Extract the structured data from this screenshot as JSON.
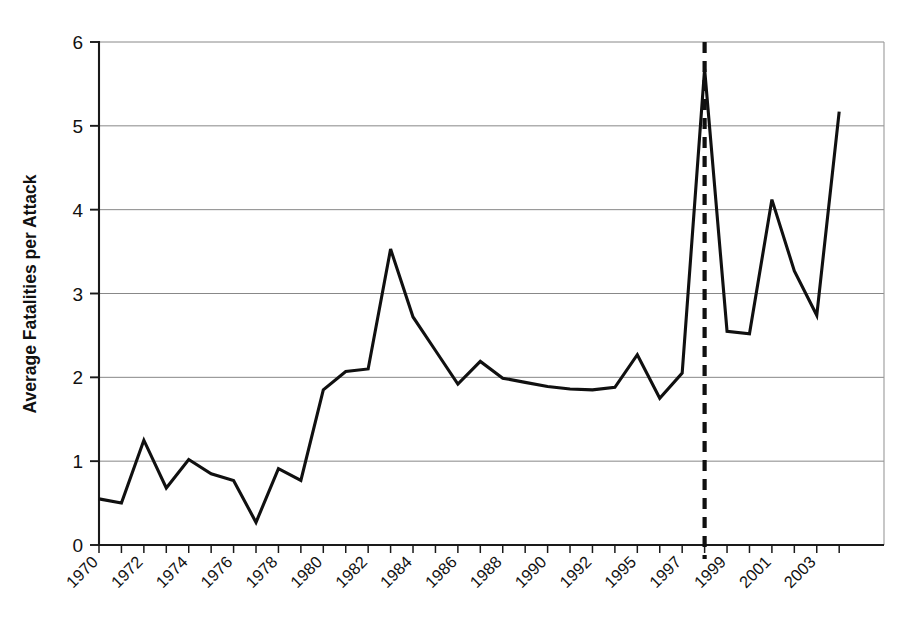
{
  "chart_data": {
    "type": "line",
    "title": "",
    "xlabel": "",
    "ylabel": "Average Fatalities per Attack",
    "ylim": [
      0,
      6
    ],
    "yticks": [
      0,
      1,
      2,
      3,
      4,
      5,
      6
    ],
    "ytick_labels": [
      "0",
      "1",
      "2",
      "3",
      "4",
      "5",
      "6"
    ],
    "grid": "horizontal",
    "legend": "none",
    "x": [
      1970,
      1971,
      1972,
      1973,
      1974,
      1975,
      1976,
      1977,
      1978,
      1979,
      1980,
      1981,
      1982,
      1983,
      1984,
      1985,
      1986,
      1987,
      1988,
      1989,
      1990,
      1991,
      1992,
      1994,
      1995,
      1996,
      1997,
      1998,
      1999,
      2000,
      2001,
      2002,
      2003,
      2004
    ],
    "xtick_labels": [
      "1970",
      "",
      "1972",
      "",
      "1974",
      "",
      "1976",
      "",
      "1978",
      "",
      "1980",
      "",
      "1982",
      "",
      "1984",
      "",
      "1986",
      "",
      "1988",
      "",
      "1990",
      "",
      "1992",
      "",
      "1995",
      "",
      "1997",
      "",
      "1999",
      "",
      "2001",
      "",
      "2003",
      ""
    ],
    "xtick_labels_shown": [
      "1970",
      "1972",
      "1974",
      "1976",
      "1978",
      "1980",
      "1982",
      "1984",
      "1986",
      "1988",
      "1990",
      "1992",
      "1995",
      "1997",
      "1999",
      "2001",
      "2003"
    ],
    "values": [
      0.55,
      0.5,
      1.25,
      0.68,
      1.02,
      0.85,
      0.77,
      0.27,
      0.91,
      0.77,
      1.85,
      2.07,
      2.1,
      3.53,
      2.72,
      2.32,
      1.92,
      2.19,
      1.99,
      1.94,
      1.89,
      1.86,
      1.85,
      1.88,
      2.27,
      1.75,
      2.05,
      5.68,
      2.55,
      2.52,
      4.12,
      3.27,
      2.74,
      5.17
    ],
    "annotations": [
      {
        "name": "vertical-marker-1998",
        "type": "vertical-dashed-line",
        "x": 1998,
        "style": "dashed",
        "color": "#101010"
      }
    ]
  },
  "colors": {
    "line": "#101010",
    "grid": "#7a7a7a",
    "axis": "#1a1a1a",
    "background": "#ffffff"
  }
}
